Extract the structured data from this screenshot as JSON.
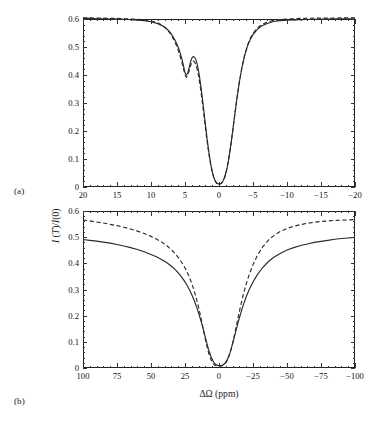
{
  "figure": {
    "axis_title_y": "I (T)/I(0)",
    "axis_title_x": "ΔΩ (ppm)",
    "panel_a_label": "(a)",
    "panel_b_label": "(b)",
    "line_color": "#2a2a2a",
    "background": "#ffffff"
  },
  "chart_data": [
    {
      "type": "line",
      "panel": "(a)",
      "title": "",
      "xlabel": "",
      "ylabel": "I (T)/I(0)",
      "xlim": [
        20,
        -20
      ],
      "ylim": [
        0,
        0.6
      ],
      "x_inverted": true,
      "grid": false,
      "legend": "none",
      "xticks": [
        20,
        15,
        10,
        5,
        0,
        -5,
        -10,
        -15,
        -20
      ],
      "xticklabels": [
        "20",
        "15",
        "10",
        "5",
        "0",
        "-5",
        "-10",
        "-15",
        "-20"
      ],
      "yticks": [
        0,
        0.1,
        0.2,
        0.3,
        0.4,
        0.5,
        0.6
      ],
      "yticklabels": [
        "0",
        "0.1",
        "0.2",
        "0.3",
        "0.4",
        "0.5",
        "0.6"
      ],
      "series": [
        {
          "name": "solid",
          "style": "solid",
          "x": [
            20,
            19,
            18,
            17,
            16,
            15,
            14,
            13,
            12,
            11,
            10.5,
            10,
            9.5,
            9,
            8.6,
            8.2,
            7.8,
            7.4,
            7.0,
            6.6,
            6.3,
            6.0,
            5.7,
            5.4,
            5.2,
            5.0,
            4.8,
            4.6,
            4.4,
            4.2,
            4.0,
            3.8,
            3.6,
            3.4,
            3.2,
            3.0,
            2.8,
            2.6,
            2.4,
            2.2,
            2.0,
            1.8,
            1.6,
            1.4,
            1.2,
            1.0,
            0.8,
            0.6,
            0.4,
            0.2,
            0,
            -0.2,
            -0.4,
            -0.6,
            -0.8,
            -1.0,
            -1.2,
            -1.4,
            -1.6,
            -1.8,
            -2.0,
            -2.3,
            -2.6,
            -3.0,
            -3.4,
            -3.8,
            -4.2,
            -4.6,
            -5.0,
            -5.6,
            -6.2,
            -7,
            -8,
            -9,
            -10,
            -12,
            -14,
            -16,
            -18,
            -20
          ],
          "y": [
            0.602,
            0.602,
            0.601,
            0.601,
            0.6,
            0.6,
            0.599,
            0.598,
            0.596,
            0.594,
            0.592,
            0.59,
            0.587,
            0.583,
            0.579,
            0.574,
            0.567,
            0.558,
            0.546,
            0.53,
            0.516,
            0.499,
            0.478,
            0.452,
            0.43,
            0.408,
            0.4,
            0.407,
            0.425,
            0.446,
            0.46,
            0.466,
            0.464,
            0.455,
            0.438,
            0.414,
            0.383,
            0.347,
            0.308,
            0.266,
            0.223,
            0.182,
            0.144,
            0.11,
            0.08,
            0.056,
            0.037,
            0.024,
            0.016,
            0.012,
            0.011,
            0.012,
            0.015,
            0.022,
            0.033,
            0.049,
            0.07,
            0.096,
            0.127,
            0.161,
            0.198,
            0.255,
            0.31,
            0.376,
            0.43,
            0.472,
            0.504,
            0.527,
            0.544,
            0.562,
            0.574,
            0.583,
            0.591,
            0.594,
            0.596,
            0.598,
            0.599,
            0.6,
            0.601,
            0.601
          ]
        },
        {
          "name": "dashed",
          "style": "dashed",
          "x": [
            20,
            19,
            18,
            17,
            16,
            15,
            14,
            13,
            12,
            11,
            10.5,
            10,
            9.5,
            9,
            8.6,
            8.2,
            7.8,
            7.4,
            7.0,
            6.6,
            6.3,
            6.0,
            5.7,
            5.4,
            5.2,
            5.0,
            4.8,
            4.6,
            4.4,
            4.2,
            4.0,
            3.8,
            3.6,
            3.4,
            3.2,
            3.0,
            2.8,
            2.6,
            2.4,
            2.2,
            2.0,
            1.8,
            1.6,
            1.4,
            1.2,
            1.0,
            0.8,
            0.6,
            0.4,
            0.2,
            0,
            -0.2,
            -0.4,
            -0.6,
            -0.8,
            -1.0,
            -1.2,
            -1.4,
            -1.6,
            -1.8,
            -2.0,
            -2.3,
            -2.6,
            -3.0,
            -3.4,
            -3.8,
            -4.2,
            -4.6,
            -5.0,
            -5.6,
            -6.2,
            -7,
            -8,
            -9,
            -10,
            -12,
            -14,
            -16,
            -18,
            -20
          ],
          "y": [
            0.604,
            0.604,
            0.603,
            0.603,
            0.602,
            0.602,
            0.601,
            0.6,
            0.599,
            0.597,
            0.595,
            0.593,
            0.59,
            0.586,
            0.581,
            0.575,
            0.567,
            0.556,
            0.542,
            0.524,
            0.508,
            0.489,
            0.466,
            0.44,
            0.42,
            0.4,
            0.392,
            0.398,
            0.414,
            0.432,
            0.445,
            0.45,
            0.447,
            0.437,
            0.42,
            0.396,
            0.366,
            0.331,
            0.293,
            0.253,
            0.212,
            0.173,
            0.137,
            0.105,
            0.077,
            0.054,
            0.036,
            0.023,
            0.015,
            0.011,
            0.01,
            0.011,
            0.014,
            0.021,
            0.032,
            0.048,
            0.069,
            0.095,
            0.126,
            0.16,
            0.197,
            0.254,
            0.309,
            0.376,
            0.431,
            0.474,
            0.507,
            0.531,
            0.549,
            0.567,
            0.579,
            0.588,
            0.595,
            0.598,
            0.6,
            0.602,
            0.603,
            0.603,
            0.604,
            0.604
          ]
        }
      ]
    },
    {
      "type": "line",
      "panel": "(b)",
      "title": "",
      "xlabel": "ΔΩ (ppm)",
      "ylabel": "I (T)/I(0)",
      "xlim": [
        100,
        -100
      ],
      "ylim": [
        0,
        0.6
      ],
      "x_inverted": true,
      "grid": false,
      "legend": "none",
      "xticks": [
        100,
        75,
        50,
        25,
        0,
        -25,
        -50,
        -75,
        -100
      ],
      "xticklabels": [
        "100",
        "75",
        "50",
        "25",
        "0",
        "-25",
        "-50",
        "-75",
        "-100"
      ],
      "yticks": [
        0,
        0.1,
        0.2,
        0.3,
        0.4,
        0.5,
        0.6
      ],
      "yticklabels": [
        "0",
        "0.1",
        "0.2",
        "0.3",
        "0.4",
        "0.5",
        "0.6"
      ],
      "series": [
        {
          "name": "solid",
          "style": "solid",
          "x": [
            100,
            95,
            90,
            85,
            80,
            75,
            70,
            65,
            60,
            55,
            50,
            46,
            42,
            38,
            35,
            32,
            29,
            26,
            24,
            22,
            20,
            18,
            16,
            15,
            14,
            13,
            12,
            11,
            10,
            9,
            8,
            7,
            6,
            5,
            4,
            3,
            2,
            1,
            0,
            -1,
            -2,
            -3,
            -4,
            -5,
            -6,
            -7,
            -8,
            -9,
            -10,
            -11,
            -12,
            -13,
            -14,
            -15,
            -16,
            -18,
            -20,
            -22,
            -25,
            -28,
            -32,
            -36,
            -40,
            -45,
            -50,
            -55,
            -60,
            -65,
            -70,
            -75,
            -80,
            -85,
            -90,
            -95,
            -100
          ],
          "y": [
            0.491,
            0.488,
            0.485,
            0.481,
            0.477,
            0.472,
            0.466,
            0.46,
            0.453,
            0.444,
            0.434,
            0.425,
            0.414,
            0.401,
            0.389,
            0.375,
            0.358,
            0.337,
            0.321,
            0.302,
            0.28,
            0.255,
            0.226,
            0.21,
            0.193,
            0.175,
            0.156,
            0.136,
            0.116,
            0.096,
            0.077,
            0.06,
            0.045,
            0.033,
            0.023,
            0.016,
            0.012,
            0.01,
            0.009,
            0.009,
            0.01,
            0.012,
            0.016,
            0.022,
            0.031,
            0.043,
            0.057,
            0.074,
            0.093,
            0.113,
            0.133,
            0.153,
            0.173,
            0.192,
            0.21,
            0.243,
            0.272,
            0.297,
            0.329,
            0.355,
            0.383,
            0.405,
            0.422,
            0.438,
            0.451,
            0.46,
            0.468,
            0.474,
            0.48,
            0.484,
            0.488,
            0.492,
            0.495,
            0.497,
            0.499
          ]
        },
        {
          "name": "dashed",
          "style": "dashed",
          "x": [
            100,
            95,
            90,
            85,
            80,
            75,
            70,
            65,
            60,
            55,
            50,
            46,
            42,
            38,
            35,
            32,
            29,
            26,
            24,
            22,
            20,
            18,
            16,
            15,
            14,
            13,
            12,
            11,
            10,
            9,
            8,
            7,
            6,
            5,
            4,
            3,
            2,
            1,
            0,
            -1,
            -2,
            -3,
            -4,
            -5,
            -6,
            -7,
            -8,
            -9,
            -10,
            -11,
            -12,
            -13,
            -14,
            -15,
            -16,
            -18,
            -20,
            -22,
            -25,
            -28,
            -32,
            -36,
            -40,
            -45,
            -50,
            -55,
            -60,
            -65,
            -70,
            -75,
            -80,
            -85,
            -90,
            -95,
            -100
          ],
          "y": [
            0.566,
            0.562,
            0.558,
            0.554,
            0.549,
            0.544,
            0.538,
            0.531,
            0.523,
            0.514,
            0.503,
            0.493,
            0.481,
            0.466,
            0.452,
            0.436,
            0.416,
            0.392,
            0.373,
            0.35,
            0.323,
            0.291,
            0.253,
            0.232,
            0.209,
            0.185,
            0.16,
            0.134,
            0.109,
            0.086,
            0.065,
            0.047,
            0.033,
            0.022,
            0.015,
            0.01,
            0.008,
            0.007,
            0.007,
            0.007,
            0.008,
            0.01,
            0.014,
            0.02,
            0.029,
            0.041,
            0.056,
            0.074,
            0.095,
            0.118,
            0.142,
            0.167,
            0.192,
            0.216,
            0.24,
            0.283,
            0.321,
            0.354,
            0.395,
            0.428,
            0.462,
            0.487,
            0.505,
            0.522,
            0.533,
            0.542,
            0.548,
            0.553,
            0.557,
            0.56,
            0.562,
            0.564,
            0.565,
            0.566,
            0.567
          ]
        }
      ]
    }
  ]
}
